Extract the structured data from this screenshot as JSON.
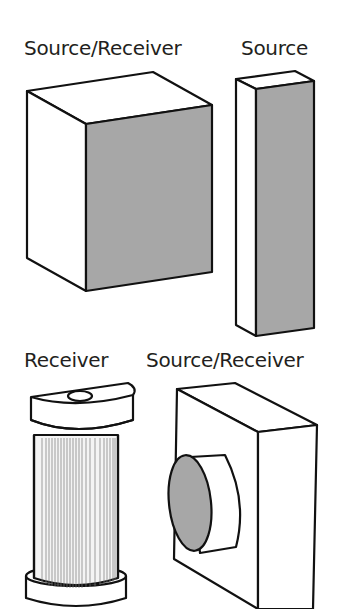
{
  "labels": {
    "top_left": "Source/Receiver",
    "top_right": "Source",
    "bottom_left": "Receiver",
    "bottom_right": "Source/Receiver"
  },
  "shapes": [
    {
      "id": "large-cube",
      "label": "Source/Receiver",
      "shaded_face": "front-right"
    },
    {
      "id": "tall-bar",
      "label": "Source",
      "shaded_face": "front"
    },
    {
      "id": "cylinder-pleated",
      "label": "Receiver",
      "shaded_face": "none"
    },
    {
      "id": "block-with-disk",
      "label": "Source/Receiver",
      "shaded_face": "disk"
    }
  ],
  "colors": {
    "stroke": "#111111",
    "shade": "#a7a7a7",
    "background": "#ffffff",
    "text": "#231f20"
  }
}
